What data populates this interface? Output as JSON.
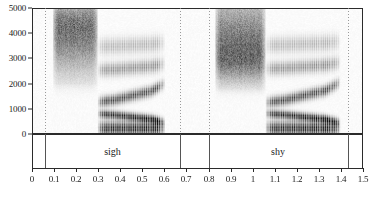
{
  "figure": {
    "type": "spectrogram"
  },
  "yaxis": {
    "label": "",
    "unit": "Hz",
    "min": 0,
    "max": 5000,
    "ticks": [
      {
        "value": 5000,
        "label": "5000"
      },
      {
        "value": 4000,
        "label": "4000"
      },
      {
        "value": 3000,
        "label": "3000"
      },
      {
        "value": 2000,
        "label": "2000"
      },
      {
        "value": 1000,
        "label": "1000"
      },
      {
        "value": 0,
        "label": "0"
      }
    ]
  },
  "xaxis": {
    "label": "",
    "unit": "s",
    "min": 0,
    "max": 1.5,
    "ticks": [
      {
        "value": 0,
        "label": "0"
      },
      {
        "value": 0.1,
        "label": "0.1"
      },
      {
        "value": 0.2,
        "label": "0.2"
      },
      {
        "value": 0.3,
        "label": "0.3"
      },
      {
        "value": 0.4,
        "label": "0.4"
      },
      {
        "value": 0.5,
        "label": "0.5"
      },
      {
        "value": 0.6,
        "label": "0.6"
      },
      {
        "value": 0.7,
        "label": "0.7"
      },
      {
        "value": 0.8,
        "label": "0.8"
      },
      {
        "value": 0.9,
        "label": "0.9"
      },
      {
        "value": 1.0,
        "label": "1"
      },
      {
        "value": 1.1,
        "label": "1.1"
      },
      {
        "value": 1.2,
        "label": "1.2"
      },
      {
        "value": 1.3,
        "label": "1.3"
      },
      {
        "value": 1.4,
        "label": "1.4"
      },
      {
        "value": 1.5,
        "label": "1.5"
      }
    ]
  },
  "boundaries": [
    0.06,
    0.67,
    0.8,
    1.43
  ],
  "segments": [
    {
      "label": "sigh",
      "start": 0.06,
      "end": 0.67
    },
    {
      "label": "shy",
      "start": 0.8,
      "end": 1.43
    }
  ],
  "chart_data": {
    "type": "heatmap",
    "title": "",
    "xlabel": "",
    "ylabel": "",
    "xlim": [
      0,
      1.5
    ],
    "ylim": [
      0,
      5000
    ],
    "grid": false,
    "legend": "none",
    "colormap": "grayscale-inverted",
    "acoustic_events": [
      {
        "word": "sigh",
        "start": 0.06,
        "end": 0.67,
        "phones": [
          {
            "symbol": "s",
            "type": "voiceless-fricative",
            "start": 0.09,
            "end": 0.295,
            "energy_band_hz": [
              2000,
              5000
            ],
            "peak_hz": 4300,
            "striations": false
          },
          {
            "symbol": "aɪ",
            "type": "diphthong",
            "start": 0.295,
            "end": 0.6,
            "striations": true,
            "f0_hz": 120,
            "formants": {
              "F1": {
                "start_hz": 780,
                "end_hz": 430
              },
              "F2": {
                "start_hz": 1250,
                "end_hz": 2000
              },
              "F3": {
                "start_hz": 2550,
                "end_hz": 2800
              },
              "F4": {
                "start_hz": 3500,
                "end_hz": 3650
              }
            }
          }
        ]
      },
      {
        "word": "shy",
        "start": 0.8,
        "end": 1.43,
        "phones": [
          {
            "symbol": "ʃ",
            "type": "voiceless-fricative",
            "start": 0.83,
            "end": 1.06,
            "energy_band_hz": [
              1800,
              4600
            ],
            "peak_hz": 3100,
            "striations": false
          },
          {
            "symbol": "aɪ",
            "type": "diphthong",
            "start": 1.06,
            "end": 1.4,
            "striations": true,
            "f0_hz": 120,
            "formants": {
              "F1": {
                "start_hz": 790,
                "end_hz": 420
              },
              "F2": {
                "start_hz": 1230,
                "end_hz": 2050
              },
              "F3": {
                "start_hz": 2600,
                "end_hz": 2850
              },
              "F4": {
                "start_hz": 3550,
                "end_hz": 3700
              }
            }
          }
        ]
      }
    ]
  },
  "colors": {
    "ink": "#2b2b2b",
    "boundary": "#8a8a8a",
    "background": "#ffffff"
  }
}
